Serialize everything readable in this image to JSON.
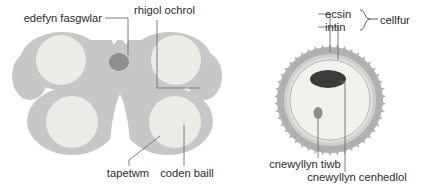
{
  "figure": {
    "title": "",
    "background_color": "#ffffff",
    "width": 425,
    "height": 186,
    "text_color": "#2b2b2b",
    "leader_color": "#6e6e78"
  },
  "colors": {
    "anther_body": "#c6c7c6",
    "anther_body_edge": "#bcbdbc",
    "pollen_sac": "#eeefe9",
    "pollen_sac_inner": "#f4f5ef",
    "vascular_bundle": "#8e8f8e",
    "exine": "#a9aaa9",
    "exine_edge": "#9a9b9a",
    "intine": "#d8d9d6",
    "cytoplasm": "#f1f2ec",
    "generative_nucleus": "#3b3b3b",
    "tube_nucleus": "#8b8c8b"
  },
  "diagrams": [
    {
      "id": "anther-cross-section",
      "name": "anther-cross-section",
      "labels": [
        {
          "id": "edefyn-fasgwlar",
          "text": "edefyn fasgwlar",
          "anchor": "end",
          "x": 102,
          "y": 21,
          "target_x": 99,
          "target_y": 61
        },
        {
          "id": "rhigol-ochrol",
          "text": "rhigol ochrol",
          "anchor": "start",
          "x": 134,
          "y": 13,
          "target_x": 174,
          "target_y": 89
        },
        {
          "id": "tapetwm",
          "text": "tapetwm",
          "anchor": "middle",
          "x": 128,
          "y": 176,
          "target_x": 156,
          "target_y": 134
        },
        {
          "id": "coden-baill",
          "text": "coden baill",
          "anchor": "middle",
          "x": 186,
          "y": 176,
          "target_x": 177,
          "target_y": 127
        }
      ]
    },
    {
      "id": "pollen-grain",
      "name": "pollen-grain-cross-section",
      "labels": [
        {
          "id": "ecsin",
          "text": "ecsin",
          "anchor": "start",
          "x": 333,
          "y": 17,
          "target_x": 310,
          "target_y": 52
        },
        {
          "id": "intin",
          "text": "intin",
          "anchor": "start",
          "x": 333,
          "y": 30,
          "target_x": 322,
          "target_y": 58
        },
        {
          "id": "cellfur",
          "text": "cellfur",
          "anchor": "start",
          "x": 384,
          "y": 24
        },
        {
          "id": "cnewyllyn-tiwb",
          "text": "cnewyllyn tiwb",
          "anchor": "middle",
          "x": 305,
          "y": 167,
          "target_x": 317,
          "target_y": 112
        },
        {
          "id": "cnewyllyn-cenhedlol",
          "text": "cnewyllyn cenhedlol",
          "anchor": "middle",
          "x": 357,
          "y": 180,
          "target_x": 334,
          "target_y": 71
        }
      ]
    }
  ]
}
